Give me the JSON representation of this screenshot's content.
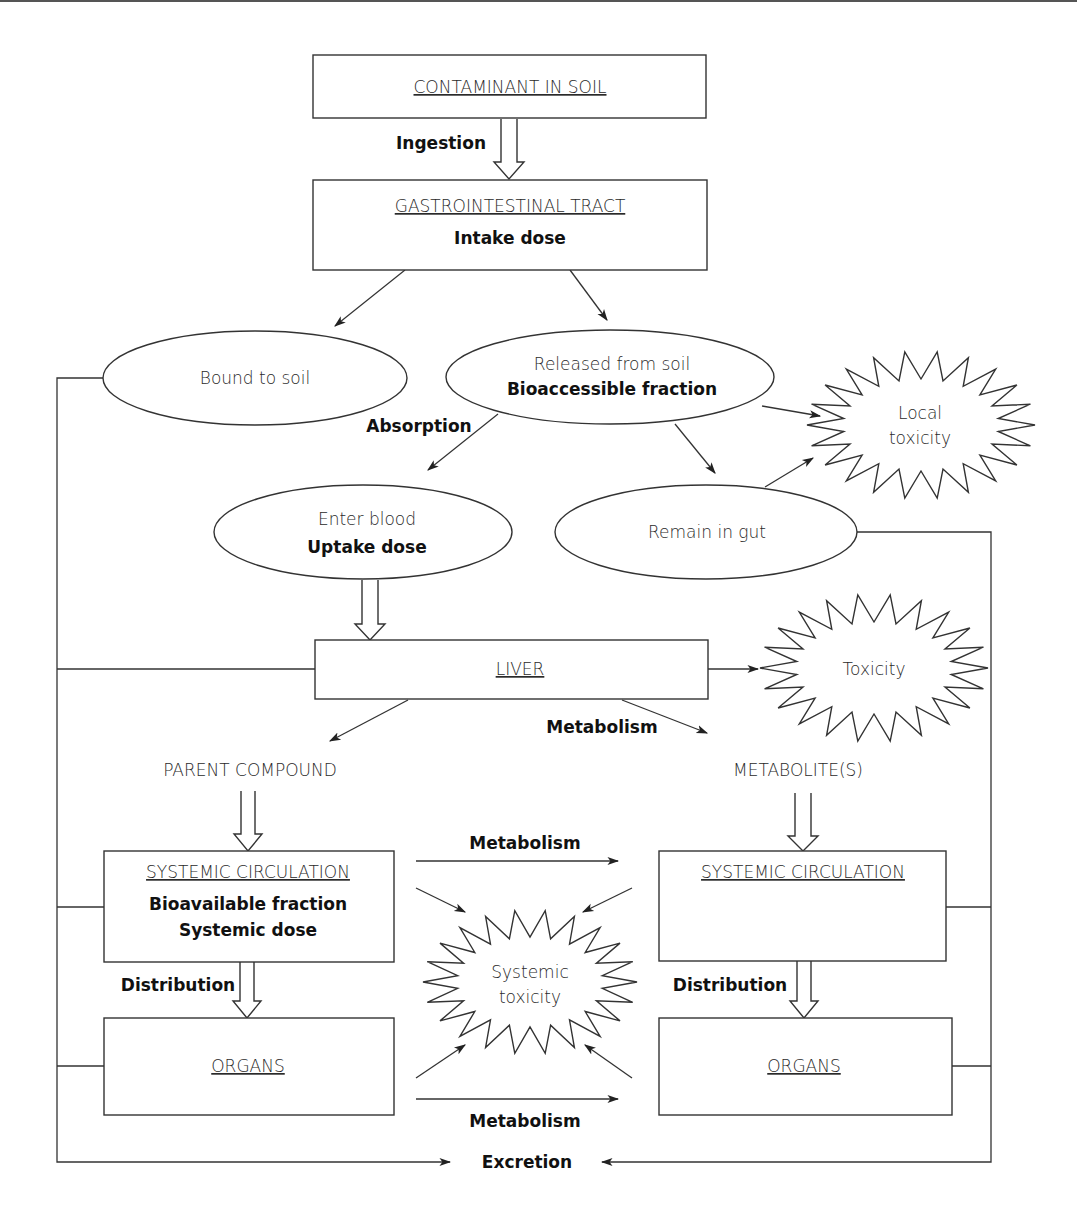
{
  "colors": {
    "line": "#333333",
    "text": "#2a2a2a",
    "background": "#ffffff"
  },
  "boxes": {
    "contaminant": {
      "title": "CONTAMINANT IN SOIL"
    },
    "gi_tract": {
      "title": "GASTROINTESTINAL TRACT",
      "subtitle": "Intake dose"
    },
    "liver": {
      "title": "LIVER"
    },
    "systemic_left": {
      "title": "SYSTEMIC CIRCULATION",
      "line1": "Bioavailable fraction",
      "line2": "Systemic dose"
    },
    "organs_left": {
      "title": "ORGANS"
    },
    "systemic_right": {
      "title": "SYSTEMIC CIRCULATION"
    },
    "organs_right": {
      "title": "ORGANS"
    }
  },
  "ellipses": {
    "bound": {
      "label": "Bound to soil"
    },
    "released": {
      "line1": "Released from soil",
      "line2": "Bioaccessible fraction"
    },
    "enter_blood": {
      "line1": "Enter blood",
      "line2": "Uptake dose"
    },
    "remain_gut": {
      "label": "Remain in gut"
    }
  },
  "starbursts": {
    "local": {
      "line1": "Local",
      "line2": "toxicity"
    },
    "toxicity": {
      "label": "Toxicity"
    },
    "systemic": {
      "line1": "Systemic",
      "line2": "toxicity"
    }
  },
  "plain_labels": {
    "parent": "PARENT COMPOUND",
    "metabolites": "METABOLITE(S)"
  },
  "edge_labels": {
    "ingestion": "Ingestion",
    "absorption": "Absorption",
    "metabolism_liver": "Metabolism",
    "metabolism_top": "Metabolism",
    "metabolism_bottom": "Metabolism",
    "distribution_left": "Distribution",
    "distribution_right": "Distribution",
    "excretion": "Excretion"
  }
}
